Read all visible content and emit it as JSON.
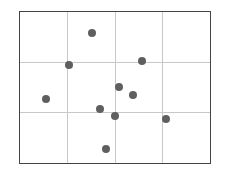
{
  "chart_data": {
    "type": "scatter",
    "title": "",
    "xlabel": "",
    "ylabel": "",
    "xlim": [
      0,
      4
    ],
    "ylim": [
      0,
      3
    ],
    "grid": true,
    "x_gridlines": [
      1,
      2,
      3
    ],
    "y_gridlines": [
      1,
      2
    ],
    "tick_labels_visible": false,
    "legend": null,
    "marker_color": "#5f5f5f",
    "grid_color": "#c8c8c8",
    "border_color": "#444444",
    "series": [
      {
        "name": "points",
        "x": [
          1.52,
          1.04,
          2.58,
          0.54,
          2.1,
          2.4,
          1.69,
          2.02,
          3.1,
          1.83
        ],
        "y": [
          2.59,
          1.94,
          2.02,
          1.27,
          1.51,
          1.35,
          1.06,
          0.92,
          0.86,
          0.27
        ]
      }
    ]
  }
}
